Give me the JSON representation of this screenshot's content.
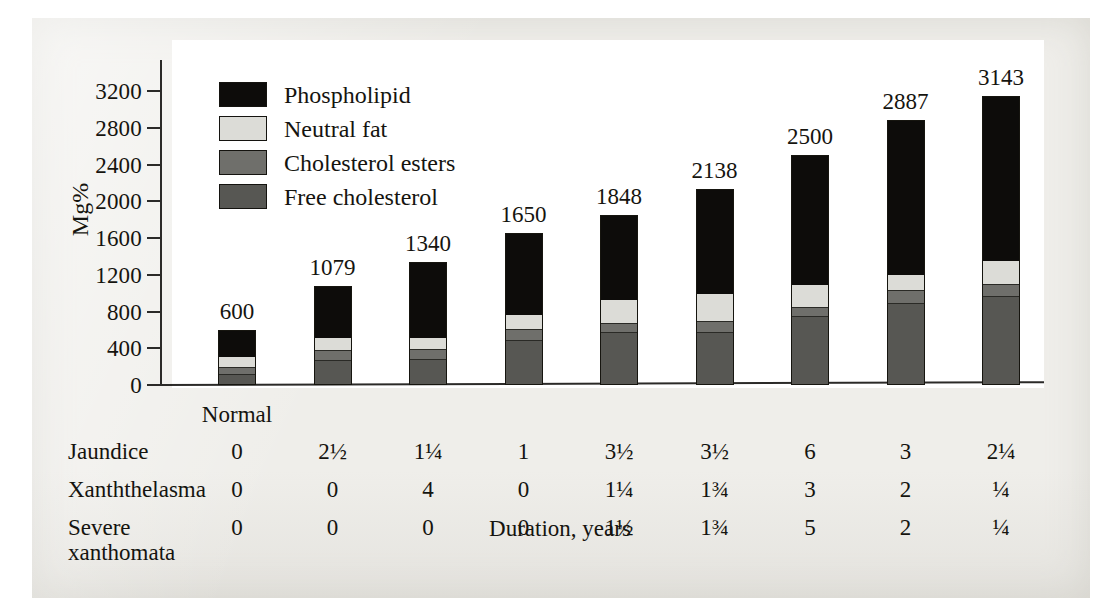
{
  "chart_data": {
    "type": "bar",
    "subtype": "stacked-bar",
    "title": "",
    "xlabel": "Duration, years",
    "ylabel": "Mg%",
    "ylim": [
      0,
      3400
    ],
    "yticks": [
      0,
      400,
      800,
      1200,
      1600,
      2000,
      2400,
      2800,
      3200
    ],
    "grid": false,
    "legend_position": "upper-left-inside",
    "categories": [
      "Normal",
      "",
      "",
      "",
      "",
      "",
      "",
      "",
      ""
    ],
    "first_category_label": "Normal",
    "totals": [
      600,
      1079,
      1340,
      1650,
      1848,
      2138,
      2500,
      2887,
      3143
    ],
    "series": [
      {
        "name": "Free cholesterol",
        "color": "#575753",
        "values": [
          100,
          260,
          270,
          480,
          570,
          570,
          740,
          880,
          960
        ]
      },
      {
        "name": "Cholesterol esters",
        "color": "#6f6f6b",
        "values": [
          80,
          100,
          100,
          110,
          90,
          110,
          90,
          140,
          120
        ]
      },
      {
        "name": "Neutral fat",
        "color": "#dcdcd7",
        "values": [
          110,
          140,
          130,
          160,
          250,
          300,
          250,
          160,
          260
        ]
      },
      {
        "name": "Phospholipid",
        "color": "#0d0c0a",
        "values": [
          310,
          579,
          840,
          900,
          938,
          1158,
          1420,
          1707,
          1803
        ]
      }
    ]
  },
  "legend": {
    "items": [
      {
        "label": "Phospholipid",
        "color": "#0d0c0a"
      },
      {
        "label": "Neutral fat",
        "color": "#dcdcd7"
      },
      {
        "label": "Cholesterol esters",
        "color": "#6f6f6b"
      },
      {
        "label": "Free cholesterol",
        "color": "#575753"
      }
    ]
  },
  "yaxis": {
    "title": "Mg%",
    "ticks": [
      "3200",
      "2800",
      "2400",
      "2000",
      "1600",
      "1200",
      "800",
      "400",
      "0"
    ]
  },
  "bar_labels": [
    "600",
    "1079",
    "1340",
    "1650",
    "1848",
    "2138",
    "2500",
    "2887",
    "3143"
  ],
  "xaxis": {
    "title": "Duration, years",
    "first_tick_label": "Normal"
  },
  "table": {
    "rows": [
      {
        "label": "Jaundice",
        "values": [
          "0",
          "2½",
          "1¼",
          "1",
          "3½",
          "3½",
          "6",
          "3",
          "2¼"
        ]
      },
      {
        "label": "Xanththelasma",
        "values": [
          "0",
          "0",
          "4",
          "0",
          "1¼",
          "1¾",
          "3",
          "2",
          "¼"
        ]
      },
      {
        "label": "Severe\nxanthomata",
        "values": [
          "0",
          "0",
          "0",
          "0",
          "1½",
          "1¾",
          "5",
          "2",
          "¼"
        ]
      }
    ]
  }
}
